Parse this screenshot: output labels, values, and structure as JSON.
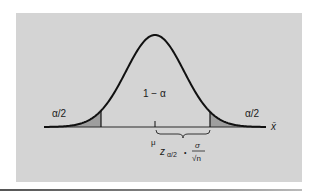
{
  "figure": {
    "colors": {
      "page_background": "#ffffff",
      "panel_background": "#d4d4d4",
      "tail_fill": "#9e9e9e",
      "curve": "#111111",
      "axis": "#2a2a2a"
    },
    "panel": {
      "x": 16,
      "y": 13,
      "width": 286,
      "height": 169
    },
    "curve": {
      "mean_px": 155,
      "sigma_px": 29,
      "baseline_y": 127,
      "peak_y": 35,
      "x_start": 44,
      "x_end": 266
    },
    "critical_lines": {
      "left_x": 101,
      "right_x": 210
    },
    "labels": {
      "center_area": "1 − α",
      "left_tail": "α/2",
      "right_tail": "α/2",
      "x_axis": "x̄",
      "mean": "μ",
      "margin_z": "z",
      "margin_z_subscript": "α/2",
      "margin_dot": "•",
      "margin_numerator": "σ",
      "margin_denominator": "√n"
    }
  }
}
